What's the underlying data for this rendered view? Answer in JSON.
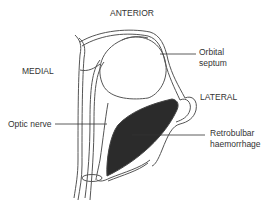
{
  "diagram": {
    "labels": {
      "anterior": "ANTERIOR",
      "medial": "MEDIAL",
      "lateral": "LATERAL",
      "orbital_septum_1": "Orbital",
      "orbital_septum_2": "septum",
      "optic_nerve": "Optic nerve",
      "retrobulbar_1": "Retrobulbar",
      "retrobulbar_2": "haemorrhage"
    },
    "colors": {
      "line": "#555555",
      "haemorrhage": "#2b2b2b"
    }
  }
}
